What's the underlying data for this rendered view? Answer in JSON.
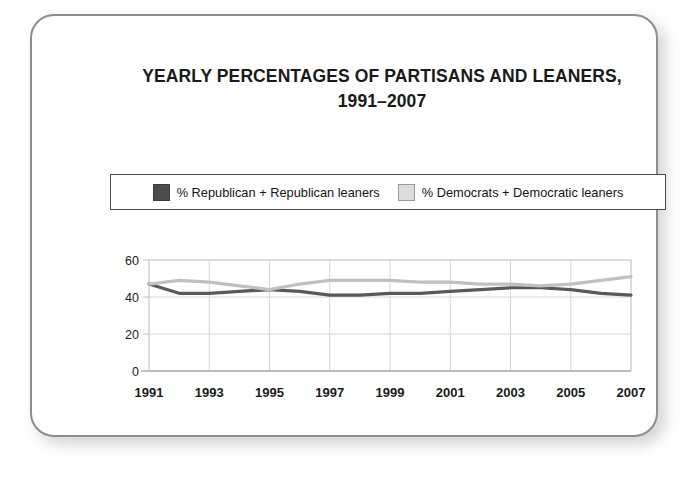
{
  "chart_data": {
    "type": "line",
    "title_line1": "YEARLY PERCENTAGES OF PARTISANS AND LEANERS,",
    "title_line2": "1991–2007",
    "xlabel": "",
    "ylabel": "",
    "xlim": [
      1991,
      2007
    ],
    "ylim": [
      0,
      60
    ],
    "yticks": [
      0,
      20,
      40,
      60
    ],
    "ytick_labels": [
      "0",
      "20",
      "40",
      "60"
    ],
    "xticks": [
      1991,
      1993,
      1995,
      1997,
      1999,
      2001,
      2003,
      2005,
      2007
    ],
    "xtick_labels": [
      "1991",
      "1993",
      "1995",
      "1997",
      "1999",
      "2001",
      "2003",
      "2005",
      "2007"
    ],
    "grid": true,
    "grid_color": "#d5d5d5",
    "legend_position": "above-plot",
    "x": [
      1991,
      1992,
      1993,
      1994,
      1995,
      1996,
      1997,
      1998,
      1999,
      2000,
      2001,
      2002,
      2003,
      2004,
      2005,
      2006,
      2007
    ],
    "series": [
      {
        "name": "% Republican + Republican leaners",
        "color": "#595959",
        "values": [
          47,
          42,
          42,
          43,
          44,
          43,
          41,
          41,
          42,
          42,
          43,
          44,
          45,
          45,
          44,
          42,
          41
        ]
      },
      {
        "name": "% Democrats + Democratic leaners",
        "color": "#c0c0c0",
        "values": [
          47,
          49,
          48,
          46,
          44,
          47,
          49,
          49,
          49,
          48,
          48,
          47,
          47,
          46,
          47,
          49,
          51
        ]
      }
    ]
  },
  "legend": {
    "entries": [
      {
        "label": "% Republican + Republican leaners",
        "swatch": "dark-gray-square"
      },
      {
        "label": "% Democrats + Democratic leaners",
        "swatch": "light-gray-square"
      }
    ]
  },
  "colors": {
    "republican_line": "#595959",
    "democrat_line": "#c0c0c0",
    "legend_border": "#4a4a4a",
    "card_border": "#8d8d8d",
    "grid": "#d5d5d5",
    "text": "#1a1a1a",
    "background": "#ffffff"
  }
}
